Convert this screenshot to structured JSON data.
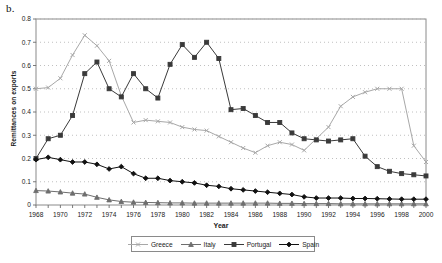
{
  "panel_label": "b.",
  "chart_data": {
    "type": "line",
    "title": "",
    "xlabel": "Year",
    "ylabel": "Remittances on exports",
    "xlim": [
      1968,
      2000
    ],
    "ylim": [
      0,
      0.8
    ],
    "ytick_values": [
      0,
      0.1,
      0.2,
      0.3,
      0.4,
      0.5,
      0.6,
      0.7,
      0.8
    ],
    "ytick_labels": [
      "0",
      "0.1",
      "0.2",
      "0.3",
      "0.4",
      "0.5",
      "0.6",
      "0.7",
      "0.8"
    ],
    "xtick_values": [
      1968,
      1970,
      1972,
      1974,
      1976,
      1978,
      1980,
      1982,
      1984,
      1986,
      1988,
      1990,
      1992,
      1994,
      1996,
      1998,
      2000
    ],
    "xtick_labels": [
      "1968",
      "1970",
      "1972",
      "1974",
      "1976",
      "1978",
      "1980",
      "1982",
      "1984",
      "1986",
      "1988",
      "1990",
      "1992",
      "1994",
      "1996",
      "1998",
      "2000"
    ],
    "grid": "horizontal-dotted",
    "legend_position": "bottom-center",
    "x": [
      1968,
      1969,
      1970,
      1971,
      1972,
      1973,
      1974,
      1975,
      1976,
      1977,
      1978,
      1979,
      1980,
      1981,
      1982,
      1983,
      1984,
      1985,
      1986,
      1987,
      1988,
      1989,
      1990,
      1991,
      1992,
      1993,
      1994,
      1995,
      1996,
      1997,
      1998,
      1999,
      2000
    ],
    "series": [
      {
        "name": "Greece",
        "color": "#a8a8a8",
        "marker": "x",
        "values": [
          0.5,
          0.505,
          0.545,
          0.645,
          0.73,
          0.685,
          0.62,
          0.47,
          0.355,
          0.365,
          0.36,
          0.355,
          0.335,
          0.325,
          0.32,
          0.295,
          0.27,
          0.245,
          0.225,
          0.255,
          0.27,
          0.26,
          0.235,
          0.285,
          0.335,
          0.425,
          0.465,
          0.485,
          0.5,
          0.5,
          0.5,
          0.255,
          0.185
        ]
      },
      {
        "name": "Italy",
        "color": "#6e6e6e",
        "marker": "triangle",
        "values": [
          0.062,
          0.06,
          0.056,
          0.051,
          0.047,
          0.033,
          0.022,
          0.015,
          0.012,
          0.011,
          0.01,
          0.009,
          0.009,
          0.008,
          0.008,
          0.008,
          0.008,
          0.008,
          0.008,
          0.008,
          0.007,
          0.007,
          0.006,
          0.006,
          0.006,
          0.005,
          0.005,
          0.005,
          0.005,
          0.005,
          0.005,
          0.005,
          0.005
        ]
      },
      {
        "name": "Portugal",
        "color": "#3a3a3a",
        "marker": "square",
        "values": [
          0.2,
          0.285,
          0.3,
          0.385,
          0.565,
          0.615,
          0.5,
          0.465,
          0.565,
          0.5,
          0.46,
          0.605,
          0.69,
          0.635,
          0.7,
          0.63,
          0.41,
          0.415,
          0.385,
          0.355,
          0.355,
          0.31,
          0.285,
          0.28,
          0.275,
          0.28,
          0.285,
          0.21,
          0.165,
          0.145,
          0.135,
          0.13,
          0.125
        ]
      },
      {
        "name": "Spain",
        "color": "#111111",
        "marker": "diamond",
        "values": [
          0.195,
          0.205,
          0.195,
          0.185,
          0.185,
          0.175,
          0.155,
          0.165,
          0.135,
          0.115,
          0.115,
          0.105,
          0.1,
          0.095,
          0.085,
          0.08,
          0.07,
          0.065,
          0.06,
          0.055,
          0.05,
          0.045,
          0.035,
          0.03,
          0.03,
          0.03,
          0.028,
          0.028,
          0.027,
          0.026,
          0.025,
          0.025,
          0.025
        ]
      }
    ]
  },
  "legend": {
    "entries": [
      {
        "label": "Greece"
      },
      {
        "label": "Italy"
      },
      {
        "label": "Portugal"
      },
      {
        "label": "Spain"
      }
    ]
  }
}
